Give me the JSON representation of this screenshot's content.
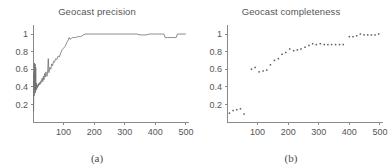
{
  "figure": {
    "background_color": "#ffffff",
    "axis_color": "#8a8a8a",
    "data_color": "#6e6e6e",
    "text_color": "#555555"
  },
  "panels": [
    {
      "caption": "(a)",
      "title": "Geocast precision"
    },
    {
      "caption": "(b)",
      "title": "Geocast completeness"
    }
  ],
  "chart_data": [
    {
      "type": "line",
      "title": "Geocast precision",
      "caption": "(a)",
      "xlabel": "",
      "ylabel": "",
      "xlim": [
        0,
        510
      ],
      "ylim": [
        0,
        1.08
      ],
      "xticks": [
        100,
        200,
        300,
        400,
        500
      ],
      "xtick_labels": [
        "100",
        "200",
        "300",
        "400",
        "500"
      ],
      "yticks": [
        0.2,
        0.4,
        0.6,
        0.8,
        1
      ],
      "ytick_labels": [
        "0.2",
        "0.4",
        "0.6",
        "0.8",
        "1"
      ],
      "grid": false,
      "legend": null,
      "series": [
        {
          "name": "precision",
          "x": [
            2,
            3,
            4,
            5,
            6,
            7,
            8,
            9,
            10,
            11,
            12,
            13,
            14,
            15,
            16,
            17,
            18,
            19,
            20,
            22,
            24,
            26,
            28,
            30,
            32,
            34,
            36,
            38,
            40,
            42,
            44,
            46,
            48,
            50,
            52,
            55,
            58,
            61,
            64,
            67,
            70,
            74,
            78,
            82,
            86,
            90,
            95,
            100,
            105,
            110,
            115,
            118,
            121,
            125,
            130,
            135,
            140,
            145,
            150,
            155,
            160,
            165,
            170,
            180,
            190,
            200,
            220,
            240,
            260,
            280,
            300,
            320,
            340,
            350,
            360,
            370,
            380,
            390,
            400,
            410,
            420,
            428,
            432,
            440,
            450,
            460,
            468,
            472,
            480,
            490,
            500
          ],
          "y": [
            0.12,
            0.55,
            0.3,
            0.67,
            0.38,
            0.66,
            0.33,
            0.62,
            0.36,
            0.44,
            0.37,
            0.42,
            0.39,
            0.41,
            0.4,
            0.43,
            0.41,
            0.44,
            0.42,
            0.45,
            0.43,
            0.47,
            0.45,
            0.5,
            0.46,
            0.52,
            0.48,
            0.55,
            0.51,
            0.57,
            0.54,
            0.52,
            0.58,
            0.72,
            0.56,
            0.62,
            0.6,
            0.66,
            0.64,
            0.69,
            0.68,
            0.72,
            0.71,
            0.75,
            0.74,
            0.78,
            0.82,
            0.84,
            0.86,
            0.9,
            0.93,
            0.96,
            0.94,
            0.95,
            0.96,
            0.96,
            0.96,
            0.97,
            0.97,
            0.97,
            0.98,
            0.99,
            1.0,
            1.0,
            1.0,
            1.0,
            1.0,
            1.0,
            1.0,
            1.0,
            1.0,
            1.0,
            1.0,
            0.99,
            0.99,
            0.99,
            1.0,
            1.0,
            1.0,
            1.0,
            1.0,
            1.0,
            0.96,
            0.96,
            0.96,
            0.96,
            0.96,
            1.0,
            1.0,
            1.0,
            1.0
          ]
        }
      ]
    },
    {
      "type": "scatter",
      "title": "Geocast completeness",
      "caption": "(b)",
      "xlabel": "",
      "ylabel": "",
      "xlim": [
        0,
        510
      ],
      "ylim": [
        0,
        1.08
      ],
      "xticks": [
        100,
        200,
        300,
        400,
        500
      ],
      "xtick_labels": [
        "100",
        "200",
        "300",
        "400",
        "500"
      ],
      "yticks": [
        0.2,
        0.4,
        0.6,
        0.8,
        1
      ],
      "ytick_labels": [
        "0.2",
        "0.4",
        "0.6",
        "0.8",
        "1"
      ],
      "grid": false,
      "legend": null,
      "series": [
        {
          "name": "completeness",
          "x": [
            8,
            20,
            32,
            44,
            56,
            80,
            92,
            105,
            118,
            130,
            142,
            155,
            168,
            180,
            192,
            205,
            218,
            230,
            242,
            255,
            268,
            280,
            292,
            305,
            318,
            330,
            342,
            355,
            368,
            380,
            400,
            412,
            424,
            436,
            448,
            460,
            472,
            484,
            496
          ],
          "y": [
            0.1,
            0.13,
            0.14,
            0.15,
            0.09,
            0.6,
            0.62,
            0.57,
            0.58,
            0.59,
            0.65,
            0.7,
            0.72,
            0.77,
            0.79,
            0.83,
            0.81,
            0.82,
            0.83,
            0.85,
            0.87,
            0.89,
            0.88,
            0.89,
            0.88,
            0.88,
            0.88,
            0.88,
            0.88,
            0.88,
            0.97,
            0.97,
            0.98,
            1.0,
            0.99,
            0.99,
            0.99,
            0.99,
            1.0
          ]
        }
      ]
    }
  ]
}
